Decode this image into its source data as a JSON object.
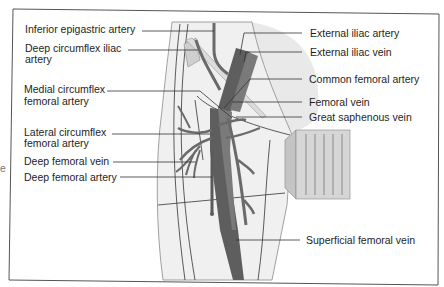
{
  "figure": {
    "edge_fragment": "e",
    "colors": {
      "background": "#ffffff",
      "frame": "#555555",
      "skin_shade": "#ebebeb",
      "skin_outline": "#8a8a8a",
      "artery": "#7a7a7a",
      "vein": "#5e5e5e",
      "vessel_dark": "#4a4a4a",
      "ligament": "#d8d8d8",
      "transducer_face": "#d6d6d6",
      "transducer_side": "#c4c4c4",
      "label_text": "#1e1e1e"
    }
  },
  "labels": {
    "left": [
      {
        "id": "inferior-epigastric-artery",
        "lines": [
          "Inferior epigastric artery"
        ]
      },
      {
        "id": "deep-circumflex-iliac-artery",
        "lines": [
          "Deep circumflex iliac",
          "artery"
        ]
      },
      {
        "id": "medial-circumflex-femoral-artery",
        "lines": [
          "Medial circumflex",
          "femoral artery"
        ]
      },
      {
        "id": "lateral-circumflex-femoral-artery",
        "lines": [
          "Lateral circumflex",
          "femoral artery"
        ]
      },
      {
        "id": "deep-femoral-vein",
        "lines": [
          "Deep femoral vein"
        ]
      },
      {
        "id": "deep-femoral-artery",
        "lines": [
          "Deep femoral artery"
        ]
      }
    ],
    "right": [
      {
        "id": "external-iliac-artery",
        "lines": [
          "External iliac artery"
        ]
      },
      {
        "id": "external-iliac-vein",
        "lines": [
          "External iliac vein"
        ]
      },
      {
        "id": "common-femoral-artery",
        "lines": [
          "Common femoral artery"
        ]
      },
      {
        "id": "femoral-vein",
        "lines": [
          "Femoral vein"
        ]
      },
      {
        "id": "great-saphenous-vein",
        "lines": [
          "Great saphenous vein"
        ]
      },
      {
        "id": "superficial-femoral-vein",
        "lines": [
          "Superficial femoral vein"
        ]
      }
    ]
  }
}
